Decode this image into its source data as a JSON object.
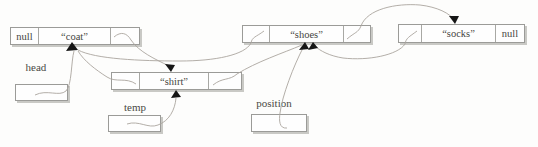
{
  "figure": {
    "background": "#fdfdfc",
    "stroke_color": "#aaa59e",
    "node_border_color": "#9b9b98",
    "node_fill": "#fefefe",
    "shadow_color": "#c9c9c5",
    "arrow_color": "#161616",
    "text_color": "#45453f",
    "nodes": {
      "coat": {
        "prev": "null",
        "value": "“coat”",
        "next": ""
      },
      "shirt": {
        "prev": "",
        "value": "“shirt”",
        "next": ""
      },
      "shoes": {
        "prev": "",
        "value": "“shoes”",
        "next": ""
      },
      "socks": {
        "prev": "",
        "value": "“socks”",
        "next": "null"
      }
    },
    "references": {
      "head": "head",
      "temp": "temp",
      "position": "position"
    }
  }
}
